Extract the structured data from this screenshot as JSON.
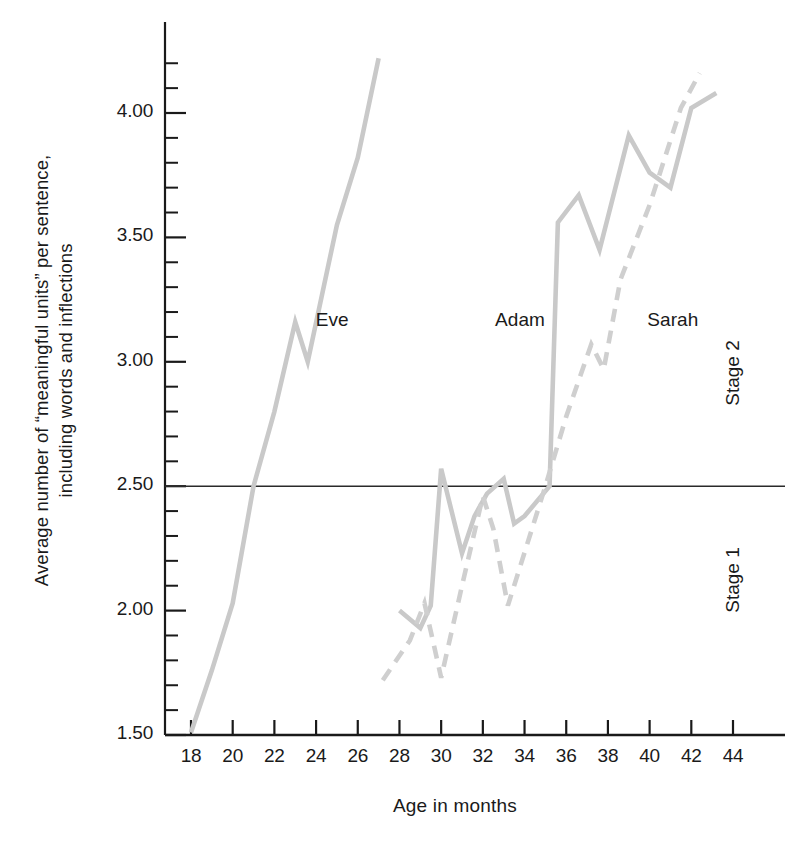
{
  "chart_data": {
    "type": "line",
    "title": "",
    "xlabel": "Age in months",
    "ylabel_line1": "Average number of “meaningful units” per sentence,",
    "ylabel_line2": "including words and inflections",
    "xlim": [
      17,
      45
    ],
    "ylim": [
      1.5,
      4.25
    ],
    "xticks": [
      18,
      20,
      22,
      24,
      26,
      28,
      30,
      32,
      34,
      36,
      38,
      40,
      42,
      44
    ],
    "xtick_labels": [
      "18",
      "20",
      "22",
      "24",
      "26",
      "28",
      "30",
      "32",
      "34",
      "36",
      "38",
      "40",
      "42",
      "44"
    ],
    "yticks": [
      1.5,
      2.0,
      2.5,
      3.0,
      3.5,
      4.0
    ],
    "ytick_labels": [
      "1.50",
      "2.00",
      "2.50",
      "3.00",
      "3.50",
      "4.00"
    ],
    "minor_ytick_step": 0.1,
    "grid": false,
    "legend_position": "inline-annotations",
    "reference_line": {
      "name": "stage-boundary",
      "y": 2.5,
      "color": "#2a2a2a",
      "label_above": "Stage 2",
      "label_below": "Stage 1"
    },
    "series": [
      {
        "name": "Eve",
        "style": "solid",
        "color": "#c9c9c9",
        "points": [
          [
            18.0,
            1.51
          ],
          [
            19.0,
            1.76
          ],
          [
            20.0,
            2.03
          ],
          [
            21.0,
            2.5
          ],
          [
            22.0,
            2.8
          ],
          [
            23.0,
            3.16
          ],
          [
            23.6,
            3.0
          ],
          [
            25.0,
            3.55
          ],
          [
            26.0,
            3.82
          ],
          [
            27.0,
            4.22
          ]
        ]
      },
      {
        "name": "Adam",
        "style": "solid",
        "color": "#c9c9c9",
        "points": [
          [
            28.0,
            2.0
          ],
          [
            29.0,
            1.93
          ],
          [
            29.5,
            2.02
          ],
          [
            30.0,
            2.57
          ],
          [
            31.0,
            2.23
          ],
          [
            31.6,
            2.38
          ],
          [
            32.2,
            2.47
          ],
          [
            33.0,
            2.53
          ],
          [
            33.5,
            2.35
          ],
          [
            34.0,
            2.38
          ],
          [
            35.2,
            2.5
          ],
          [
            35.6,
            3.56
          ],
          [
            36.6,
            3.67
          ],
          [
            37.6,
            3.45
          ],
          [
            39.0,
            3.91
          ],
          [
            40.0,
            3.76
          ],
          [
            41.0,
            3.7
          ],
          [
            42.0,
            4.02
          ],
          [
            43.2,
            4.08
          ]
        ]
      },
      {
        "name": "Sarah",
        "style": "dashed",
        "color": "#cfcfcf",
        "points": [
          [
            27.2,
            1.72
          ],
          [
            28.5,
            1.88
          ],
          [
            29.2,
            2.03
          ],
          [
            30.0,
            1.73
          ],
          [
            31.0,
            2.1
          ],
          [
            32.0,
            2.46
          ],
          [
            32.5,
            2.33
          ],
          [
            33.2,
            2.02
          ],
          [
            35.0,
            2.5
          ],
          [
            36.0,
            2.78
          ],
          [
            37.2,
            3.07
          ],
          [
            37.8,
            2.97
          ],
          [
            38.6,
            3.33
          ],
          [
            40.0,
            3.63
          ],
          [
            41.5,
            4.02
          ],
          [
            42.4,
            4.16
          ]
        ]
      }
    ],
    "annotations": [
      {
        "text": "Eve",
        "x": 23.6,
        "y": 3.16
      },
      {
        "text": "Adam",
        "x": 32.2,
        "y": 3.16
      },
      {
        "text": "Sarah",
        "x": 39.5,
        "y": 3.16
      }
    ]
  },
  "axis": {
    "axis_color": "#1a1a1a"
  }
}
